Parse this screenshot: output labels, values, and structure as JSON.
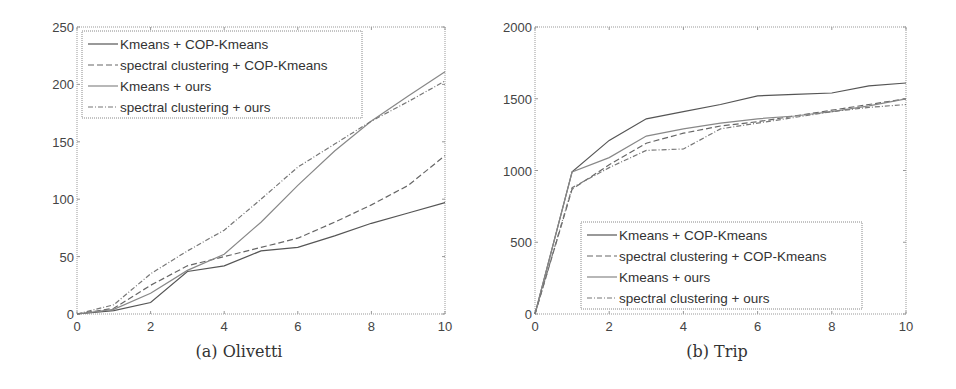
{
  "chart_data": [
    {
      "type": "line",
      "title": "",
      "caption": "(a) Olivetti",
      "xlabel": "",
      "ylabel": "",
      "xlim": [
        0,
        10
      ],
      "ylim": [
        0,
        250
      ],
      "xticks": [
        0,
        2,
        4,
        6,
        8,
        10
      ],
      "yticks": [
        0,
        50,
        100,
        150,
        200,
        250
      ],
      "grid": false,
      "legend_position": "upper left",
      "x": [
        0,
        1,
        2,
        3,
        4,
        5,
        6,
        7,
        8,
        9,
        10
      ],
      "series": [
        {
          "name": "Kmeans + COP-Kmeans",
          "style": "solid",
          "values": [
            0,
            3,
            10,
            37,
            42,
            55,
            58,
            68,
            79,
            88,
            97
          ]
        },
        {
          "name": "spectral clustering + COP-Kmeans",
          "style": "dashed",
          "values": [
            0,
            5,
            25,
            42,
            50,
            58,
            66,
            80,
            95,
            112,
            138
          ]
        },
        {
          "name": "Kmeans + ours",
          "style": "solid",
          "values": [
            0,
            4,
            18,
            38,
            52,
            80,
            112,
            142,
            168,
            190,
            211
          ]
        },
        {
          "name": "spectral clustering + ours",
          "style": "dashdot",
          "values": [
            0,
            8,
            35,
            55,
            73,
            100,
            128,
            148,
            168,
            185,
            203
          ]
        }
      ]
    },
    {
      "type": "line",
      "title": "",
      "caption": "(b) Trip",
      "xlabel": "",
      "ylabel": "",
      "xlim": [
        0,
        10
      ],
      "ylim": [
        0,
        2000
      ],
      "xticks": [
        0,
        2,
        4,
        6,
        8,
        10
      ],
      "yticks": [
        0,
        500,
        1000,
        1500,
        2000
      ],
      "grid": false,
      "legend_position": "lower right-center",
      "x": [
        0,
        1,
        2,
        3,
        4,
        5,
        6,
        7,
        8,
        9,
        10
      ],
      "series": [
        {
          "name": "Kmeans + COP-Kmeans",
          "style": "solid",
          "values": [
            0,
            990,
            1210,
            1360,
            1410,
            1460,
            1520,
            1530,
            1540,
            1590,
            1610
          ]
        },
        {
          "name": "spectral clustering + COP-Kmeans",
          "style": "dashed",
          "values": [
            0,
            870,
            1040,
            1190,
            1260,
            1310,
            1340,
            1380,
            1420,
            1460,
            1500
          ]
        },
        {
          "name": "Kmeans + ours",
          "style": "solid",
          "values": [
            0,
            990,
            1090,
            1240,
            1290,
            1330,
            1360,
            1380,
            1410,
            1450,
            1500
          ]
        },
        {
          "name": "spectral clustering + ours",
          "style": "dashdot",
          "values": [
            0,
            880,
            1020,
            1140,
            1150,
            1290,
            1330,
            1370,
            1410,
            1440,
            1460
          ]
        }
      ]
    }
  ],
  "figures": {
    "a": {
      "caption": "(a) Olivetti"
    },
    "b": {
      "caption": "(b) Trip"
    }
  }
}
